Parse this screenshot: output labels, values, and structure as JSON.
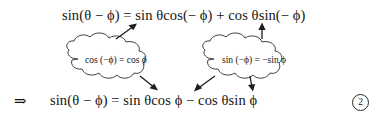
{
  "figure": {
    "equation_number": "2",
    "implies_symbol": "⇒",
    "top_equation": "sin(θ − ϕ) = sin θcos(− ϕ) + cos θsin(− ϕ)",
    "bottom_equation": "sin(θ − ϕ) = sin θcos ϕ − cos θsin ϕ",
    "callouts": [
      {
        "id": "left",
        "text": "cos (−ϕ) = cos ϕ"
      },
      {
        "id": "right",
        "text": "sin (−ϕ) = −sin ϕ"
      }
    ],
    "colors": {
      "background": "#ffffff",
      "ink": "#141414",
      "stroke": "#2b2b2b"
    }
  }
}
